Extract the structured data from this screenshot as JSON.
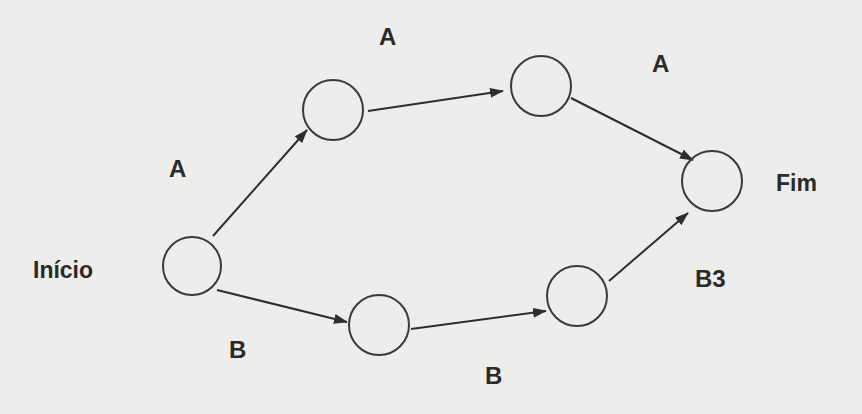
{
  "diagram": {
    "type": "network-graph",
    "background": "#ededeb",
    "stroke_color": "#2e2e2e",
    "nodes": [
      {
        "id": "start",
        "label": "Início",
        "cx": 192,
        "cy": 266,
        "r": 29
      },
      {
        "id": "a1",
        "cx": 333,
        "cy": 110,
        "r": 30
      },
      {
        "id": "a2",
        "cx": 541,
        "cy": 86,
        "r": 30
      },
      {
        "id": "end",
        "label": "Fim",
        "cx": 712,
        "cy": 181,
        "r": 30
      },
      {
        "id": "b1",
        "cx": 379,
        "cy": 325,
        "r": 30
      },
      {
        "id": "b2",
        "cx": 577,
        "cy": 296,
        "r": 30
      }
    ],
    "edges": [
      {
        "from": "start",
        "to": "a1",
        "label": "A"
      },
      {
        "from": "a1",
        "to": "a2",
        "label": "A"
      },
      {
        "from": "a2",
        "to": "end",
        "label": "A"
      },
      {
        "from": "start",
        "to": "b1",
        "label": "B"
      },
      {
        "from": "b1",
        "to": "b2",
        "label": "B"
      },
      {
        "from": "b2",
        "to": "end",
        "label": "B3"
      }
    ],
    "labels": {
      "start": "Início",
      "end": "Fim",
      "edge_start_a1": "A",
      "edge_a1_a2": "A",
      "edge_a2_end": "A",
      "edge_start_b1": "B",
      "edge_b1_b2": "B",
      "edge_b2_end": "B3"
    }
  }
}
